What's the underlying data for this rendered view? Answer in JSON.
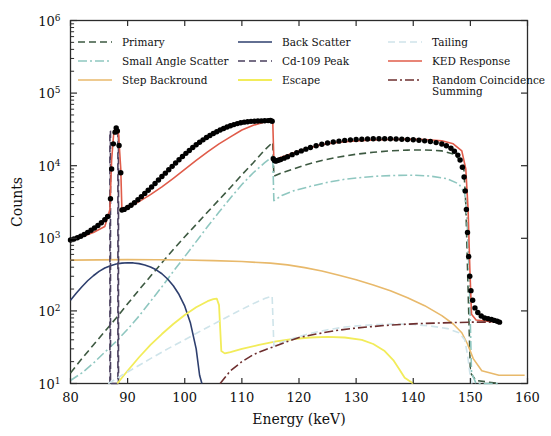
{
  "chart_data": {
    "type": "line",
    "title": "",
    "xlabel": "Energy (keV)",
    "ylabel": "Counts",
    "xlim": [
      80,
      160
    ],
    "ylim": [
      10,
      1000000
    ],
    "yscale": "log",
    "grid": false,
    "legend_position": "top-inside",
    "xticks": [
      80,
      90,
      100,
      110,
      120,
      130,
      140,
      150,
      160
    ],
    "ytick_labels": [
      "10^1",
      "10^2",
      "10^3",
      "10^4",
      "10^5",
      "10^6"
    ],
    "ytick_mantissa": [
      "10",
      "10",
      "10",
      "10",
      "10",
      "10"
    ],
    "ytick_exponents": [
      "1",
      "2",
      "3",
      "4",
      "5",
      "6"
    ],
    "legend": [
      {
        "name": "Primary",
        "color": "#3d5941",
        "dash": "7,4",
        "width": 1.6
      },
      {
        "name": "Small Angle Scatter",
        "color": "#8fc7c0",
        "dash": "9,3,2,3",
        "width": 1.6
      },
      {
        "name": "Step Backround",
        "color": "#e8b96b",
        "dash": "none",
        "width": 1.6
      },
      {
        "name": "Back Scatter",
        "color": "#2e3f6e",
        "dash": "none",
        "width": 1.6
      },
      {
        "name": "Cd-109 Peak",
        "color": "#4a3f5e",
        "dash": "7,4",
        "width": 1.6
      },
      {
        "name": "Escape",
        "color": "#f2ec5a",
        "dash": "none",
        "width": 1.8
      },
      {
        "name": "Tailing",
        "color": "#cfe4ea",
        "dash": "7,4",
        "width": 1.6
      },
      {
        "name": "KED Response",
        "color": "#e05c4a",
        "dash": "none",
        "width": 1.6
      },
      {
        "name": "Random Coincidence Summing",
        "color": "#6e2f2f",
        "dash": "9,3,2,3",
        "width": 1.6
      }
    ],
    "series": [
      {
        "name": "Primary",
        "color": "#3d5941",
        "dash": "7,4",
        "width": 1.6,
        "x": [
          80,
          82,
          84,
          86,
          88,
          90,
          92,
          94,
          96,
          98,
          100,
          102,
          104,
          106,
          108,
          110,
          112,
          114,
          115.4,
          115.6,
          117,
          119,
          121,
          124,
          127,
          130,
          133,
          136,
          139,
          142,
          145,
          147,
          148.8,
          149.2,
          149.6,
          150,
          151,
          155
        ],
        "y": [
          14,
          22,
          34,
          52,
          80,
          125,
          195,
          300,
          460,
          700,
          1050,
          1550,
          2300,
          3400,
          5000,
          7500,
          11000,
          16500,
          21000,
          7200,
          8000,
          9000,
          10200,
          11800,
          13200,
          14400,
          15300,
          16000,
          16400,
          16500,
          16000,
          14500,
          11000,
          3000,
          200,
          14,
          11,
          10
        ]
      },
      {
        "name": "Small Angle Scatter",
        "color": "#8fc7c0",
        "dash": "9,3,2,3",
        "width": 1.6,
        "x": [
          80,
          82,
          84,
          86,
          88,
          90,
          92,
          94,
          96,
          98,
          100,
          102,
          104,
          106,
          108,
          110,
          112,
          114,
          115.4,
          115.6,
          117,
          119,
          122,
          125,
          128,
          131,
          134,
          137,
          140,
          143,
          146,
          148,
          149,
          149.4,
          149.8,
          150.2,
          151,
          155
        ],
        "y": [
          11,
          14,
          19,
          27,
          38,
          56,
          85,
          135,
          215,
          350,
          560,
          900,
          1450,
          2300,
          3600,
          5500,
          8000,
          11000,
          13500,
          3300,
          3900,
          4500,
          5200,
          5900,
          6500,
          6900,
          7200,
          7350,
          7400,
          7200,
          6600,
          5600,
          4200,
          2000,
          300,
          14,
          10,
          10
        ]
      },
      {
        "name": "Step Backround",
        "color": "#e8b96b",
        "dash": "none",
        "width": 1.6,
        "x": [
          80,
          85,
          90,
          95,
          100,
          105,
          110,
          115,
          118,
          121,
          124,
          127,
          130,
          133,
          136,
          139,
          142,
          145,
          147,
          148.5,
          149.5,
          150.5,
          152,
          155,
          159.5
        ],
        "y": [
          500,
          505,
          508,
          507,
          502,
          492,
          478,
          455,
          430,
          395,
          355,
          310,
          268,
          228,
          190,
          152,
          118,
          86,
          66,
          50,
          35,
          22,
          15,
          13,
          13
        ]
      },
      {
        "name": "Back Scatter",
        "color": "#2e3f6e",
        "dash": "none",
        "width": 1.6,
        "x": [
          80,
          81,
          82,
          83,
          84,
          85,
          86,
          87,
          88,
          89,
          90,
          91,
          92,
          93,
          94,
          95,
          96,
          97,
          98,
          99,
          100,
          101,
          102,
          102.6,
          103
        ],
        "y": [
          140,
          175,
          215,
          260,
          305,
          350,
          390,
          420,
          442,
          455,
          460,
          458,
          448,
          430,
          403,
          368,
          325,
          275,
          222,
          168,
          116,
          68,
          30,
          13,
          10
        ]
      },
      {
        "name": "Cd-109 Peak",
        "color": "#4a3f5e",
        "dash": "7,4",
        "width": 1.6,
        "x": [
          86.9,
          86.9,
          87.0,
          87.0,
          88.3,
          88.3,
          88.4,
          88.4
        ],
        "y": [
          10,
          30000,
          30000,
          10,
          10,
          30000,
          30000,
          10
        ]
      },
      {
        "name": "Escape",
        "color": "#f2ec5a",
        "dash": "none",
        "width": 1.8,
        "x": [
          88.2,
          89,
          90,
          92,
          94,
          96,
          98,
          100,
          102,
          104,
          105,
          105.6,
          106,
          106.4,
          107,
          108,
          110,
          113,
          116,
          119,
          122,
          125,
          128,
          131,
          133,
          135,
          136.5,
          137.5,
          138.5,
          140
        ],
        "y": [
          10,
          12,
          15,
          23,
          34,
          48,
          66,
          88,
          112,
          136,
          145,
          148,
          120,
          28,
          26,
          27,
          30,
          34,
          38,
          41,
          43,
          44,
          43,
          40,
          35,
          28,
          21,
          16,
          12,
          10
        ]
      },
      {
        "name": "Tailing",
        "color": "#cfe4ea",
        "dash": "7,4",
        "width": 1.6,
        "x": [
          86.6,
          87.5,
          89,
          91,
          94,
          97,
          100,
          103,
          106,
          109,
          112,
          114,
          115.3,
          115.6,
          117,
          119,
          122,
          125,
          128,
          131,
          134,
          137,
          140,
          143,
          146,
          148,
          149,
          149.5,
          149.9,
          150.3
        ],
        "y": [
          10,
          11,
          13,
          16,
          22,
          30,
          40,
          54,
          72,
          96,
          126,
          148,
          160,
          33,
          37,
          42,
          49,
          55,
          60,
          63,
          65,
          66,
          65,
          62,
          57,
          50,
          40,
          25,
          14,
          10
        ]
      },
      {
        "name": "KED Response",
        "color": "#e05c4a",
        "dash": "none",
        "width": 1.6,
        "x": [
          80,
          82,
          84,
          86,
          86.9,
          87.2,
          87.6,
          88,
          88.4,
          88.8,
          89,
          90,
          92,
          94,
          96,
          98,
          100,
          102,
          104,
          106,
          108,
          110,
          112,
          114,
          115.4,
          115.6,
          117,
          119,
          121,
          124,
          127,
          130,
          133,
          136,
          139,
          142,
          145,
          147,
          148.5,
          149.2,
          149.6,
          149.9,
          150.2,
          151,
          153,
          155
        ],
        "y": [
          950,
          1050,
          1200,
          1450,
          2500,
          12000,
          30000,
          33000,
          28000,
          9000,
          2400,
          2600,
          3200,
          4000,
          5100,
          6700,
          8900,
          11800,
          15500,
          20000,
          25000,
          31000,
          36000,
          40000,
          42000,
          12000,
          13200,
          15000,
          17000,
          19500,
          21000,
          22000,
          22600,
          23000,
          23200,
          23000,
          22000,
          20000,
          16000,
          9000,
          2500,
          400,
          90,
          75,
          72,
          70
        ]
      },
      {
        "name": "Random Coincidence Summing",
        "color": "#6e2f2f",
        "dash": "9,3,2,3",
        "width": 1.6,
        "x": [
          106.2,
          107,
          108,
          110,
          112,
          114,
          116,
          118,
          120,
          123,
          126,
          129,
          132,
          135,
          138,
          141,
          144,
          147,
          150,
          153,
          155.5
        ],
        "y": [
          10,
          12,
          15,
          20,
          25,
          29,
          33,
          38,
          43,
          48,
          53,
          57,
          60,
          63,
          65,
          67,
          68,
          69,
          70,
          70,
          70
        ]
      }
    ],
    "measured": {
      "name": "Measured Spectrum",
      "color": "#000000",
      "marker": "o",
      "marker_size": 4.2,
      "x": [
        80,
        80.6,
        81.2,
        81.8,
        82.4,
        83,
        83.6,
        84.2,
        84.8,
        85.4,
        86,
        86.5,
        87,
        87.2,
        87.5,
        87.8,
        88,
        88.2,
        88.5,
        88.8,
        89,
        89.4,
        90,
        90.6,
        91.2,
        91.8,
        92.4,
        93,
        93.6,
        94.2,
        94.8,
        95.4,
        96,
        96.6,
        97.2,
        97.8,
        98.4,
        99,
        99.6,
        100.2,
        100.8,
        101.4,
        102,
        102.6,
        103.2,
        103.8,
        104.4,
        105,
        105.6,
        106.2,
        106.8,
        107.4,
        108,
        108.6,
        109.2,
        109.8,
        110.4,
        111,
        111.6,
        112.2,
        112.8,
        113.4,
        114,
        114.6,
        115,
        115.3,
        115.5,
        115.7,
        115.9,
        116.1,
        116.4,
        116.8,
        117.4,
        118,
        118.8,
        119.6,
        120.4,
        121.2,
        122,
        123,
        124,
        125,
        126,
        127,
        128,
        129,
        130,
        131,
        132,
        133,
        134,
        135,
        136,
        137,
        138,
        139,
        140,
        141,
        142,
        143,
        144,
        145,
        145.8,
        146.6,
        147.2,
        147.8,
        148.2,
        148.6,
        148.9,
        149.1,
        149.3,
        149.5,
        149.7,
        149.9,
        150.1,
        150.4,
        150.8,
        151.3,
        151.9,
        152.5,
        153.1,
        153.7,
        154.2,
        154.7,
        155.1
      ],
      "y": [
        950,
        980,
        1020,
        1070,
        1130,
        1200,
        1290,
        1390,
        1500,
        1640,
        1800,
        2000,
        3500,
        9000,
        20000,
        29000,
        33000,
        30000,
        19000,
        8000,
        2450,
        2500,
        2650,
        2850,
        3100,
        3400,
        3750,
        4150,
        4600,
        5100,
        5700,
        6350,
        7100,
        7900,
        8800,
        9800,
        10900,
        12100,
        13400,
        14800,
        16200,
        17800,
        19400,
        21000,
        22700,
        24400,
        26000,
        27700,
        29300,
        31000,
        32600,
        34100,
        35500,
        36800,
        38000,
        39000,
        39800,
        40400,
        40800,
        41000,
        41200,
        41400,
        41600,
        41800,
        41900,
        41000,
        12500,
        11800,
        11600,
        11700,
        11900,
        12200,
        12700,
        13300,
        14200,
        15100,
        16000,
        16900,
        17800,
        18800,
        19700,
        20500,
        21200,
        21800,
        22300,
        22700,
        23000,
        23200,
        23350,
        23450,
        23500,
        23500,
        23450,
        23350,
        23200,
        23000,
        22750,
        22400,
        22000,
        21500,
        20800,
        19900,
        18800,
        17400,
        15800,
        14000,
        12000,
        9500,
        7000,
        4500,
        2500,
        1200,
        560,
        300,
        190,
        140,
        110,
        95,
        85,
        80,
        78,
        76,
        74,
        72,
        70,
        68
      ]
    }
  },
  "axes": {
    "x_title": "Energy (keV)",
    "y_title": "Counts"
  }
}
